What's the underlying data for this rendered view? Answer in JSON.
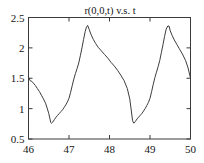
{
  "chart_data": {
    "type": "line",
    "title": "r(0,0,t) v.s. t",
    "xlabel": "",
    "ylabel": "",
    "xlim": [
      46,
      50
    ],
    "ylim": [
      0.5,
      2.5
    ],
    "grid": false,
    "legend": null,
    "xticks": [
      46,
      47,
      48,
      49,
      50
    ],
    "xtick_labels": [
      "46",
      "47",
      "48",
      "49",
      "50"
    ],
    "yticks": [
      0.5,
      1,
      1.5,
      2,
      2.5
    ],
    "ytick_labels": [
      "0.5",
      "1",
      "1.5",
      "2",
      "2.5"
    ],
    "line_color": "#3d3d3d",
    "series": [
      {
        "name": "r(0,0,t)",
        "x": [
          46.0,
          46.04,
          46.08,
          46.12,
          46.17,
          46.22,
          46.27,
          46.32,
          46.37,
          46.42,
          46.46,
          46.5,
          46.53,
          46.55,
          46.57,
          46.6,
          46.64,
          46.68,
          46.72,
          46.76,
          46.8,
          46.84,
          46.88,
          46.92,
          46.96,
          47.0,
          47.04,
          47.08,
          47.12,
          47.16,
          47.2,
          47.24,
          47.28,
          47.32,
          47.36,
          47.4,
          47.43,
          47.46,
          47.5,
          47.55,
          47.6,
          47.66,
          47.72,
          47.8,
          47.88,
          47.96,
          48.04,
          48.12,
          48.2,
          48.28,
          48.36,
          48.44,
          48.5,
          48.54,
          48.57,
          48.6,
          48.64,
          48.68,
          48.72,
          48.76,
          48.8,
          48.84,
          48.88,
          48.92,
          48.96,
          49.0,
          49.04,
          49.08,
          49.12,
          49.16,
          49.2,
          49.24,
          49.28,
          49.32,
          49.36,
          49.4,
          49.44,
          49.47,
          49.5,
          49.55,
          49.6,
          49.66,
          49.72,
          49.8,
          49.88,
          49.94,
          50.0
        ],
        "y": [
          1.52,
          1.46,
          1.45,
          1.42,
          1.38,
          1.33,
          1.28,
          1.22,
          1.16,
          1.09,
          1.01,
          0.92,
          0.83,
          0.77,
          0.76,
          0.78,
          0.82,
          0.86,
          0.89,
          0.92,
          0.95,
          0.98,
          1.02,
          1.06,
          1.11,
          1.17,
          1.27,
          1.38,
          1.49,
          1.58,
          1.66,
          1.75,
          1.87,
          2.0,
          2.14,
          2.27,
          2.34,
          2.37,
          2.3,
          2.21,
          2.14,
          2.07,
          2.01,
          1.95,
          1.89,
          1.83,
          1.76,
          1.7,
          1.63,
          1.55,
          1.46,
          1.33,
          1.16,
          0.96,
          0.8,
          0.76,
          0.79,
          0.83,
          0.86,
          0.89,
          0.92,
          0.96,
          1.0,
          1.05,
          1.1,
          1.17,
          1.28,
          1.4,
          1.51,
          1.6,
          1.69,
          1.79,
          1.92,
          2.05,
          2.19,
          2.31,
          2.36,
          2.36,
          2.28,
          2.2,
          2.13,
          2.06,
          1.99,
          1.9,
          1.79,
          1.67,
          1.5
        ]
      }
    ]
  },
  "axes": {
    "title": "r(0,0,t) v.s. t"
  }
}
